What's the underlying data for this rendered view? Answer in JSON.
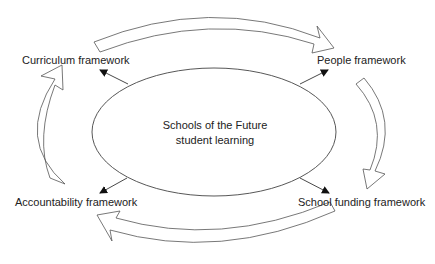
{
  "diagram": {
    "center": {
      "line1": "Schools of the Future",
      "line2": "student learning"
    },
    "nodes": {
      "curriculum": "Curriculum framework",
      "people": "People framework",
      "school_funding": "School funding framework",
      "accountability": "Accountability framework"
    },
    "cycle_direction": "clockwise",
    "cycle_order": [
      "Curriculum framework",
      "People framework",
      "School funding framework",
      "Accountability framework"
    ],
    "colors": {
      "stroke": "#555555",
      "text": "#222222",
      "background": "#ffffff"
    }
  }
}
